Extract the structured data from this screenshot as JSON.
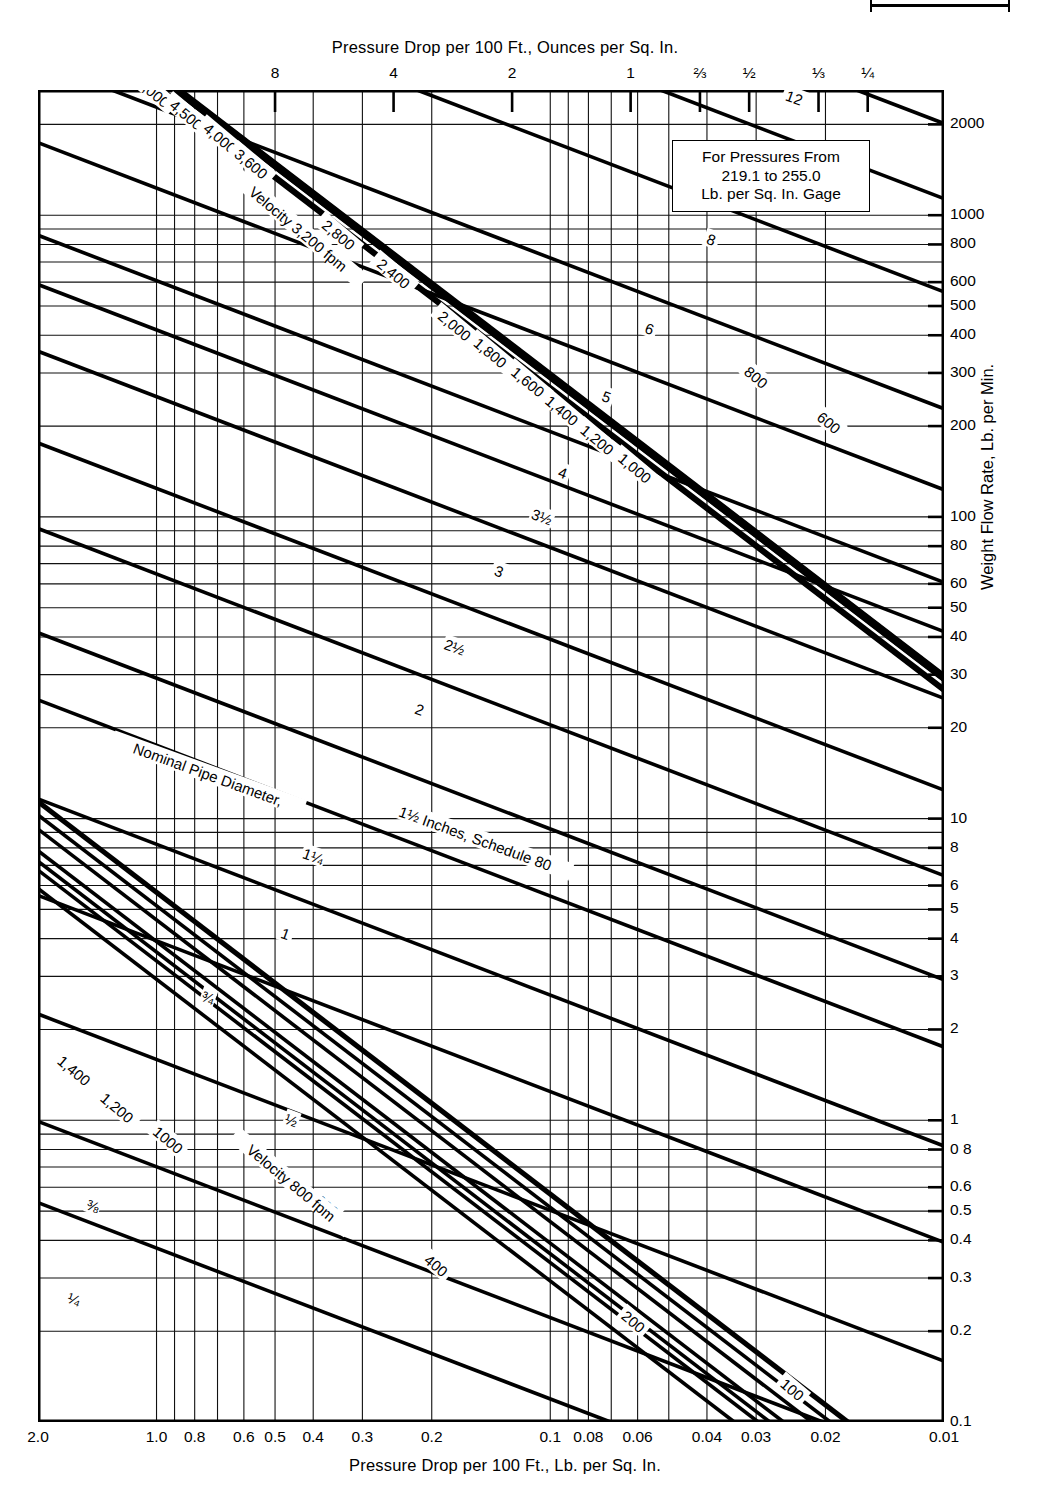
{
  "chart_data": {
    "type": "line",
    "title": "Pressure Drop per 100 Ft., Ounces per Sq. In.",
    "xlabel": "Pressure Drop per 100 Ft., Lb. per Sq. In.",
    "ylabel": "Weight Flow Rate, Lb. per Min.",
    "top_axis_label": "Pressure Drop per 100 Ft., Ounces per Sq. In.",
    "note": {
      "line1": "For Pressures From",
      "line2": "219.1 to 255.0",
      "line3": "Lb. per Sq. In. Gage"
    },
    "grid": "log-log",
    "xlim": [
      2.0,
      0.01
    ],
    "ylim": [
      0.1,
      2600
    ],
    "x_ticks": [
      {
        "label": "2.0",
        "value": 2.0
      },
      {
        "label": "1.0",
        "value": 1.0
      },
      {
        "label": "0.8",
        "value": 0.8
      },
      {
        "label": "0.6",
        "value": 0.6
      },
      {
        "label": "0.5",
        "value": 0.5
      },
      {
        "label": "0.4",
        "value": 0.4
      },
      {
        "label": "0.3",
        "value": 0.3
      },
      {
        "label": "0.2",
        "value": 0.2
      },
      {
        "label": "0.1",
        "value": 0.1
      },
      {
        "label": "0.08",
        "value": 0.08
      },
      {
        "label": "0.06",
        "value": 0.06
      },
      {
        "label": "0.04",
        "value": 0.04
      },
      {
        "label": "0.03",
        "value": 0.03
      },
      {
        "label": "0.02",
        "value": 0.02
      },
      {
        "label": "0.01",
        "value": 0.01
      }
    ],
    "x_ticks_top_ounces": [
      {
        "label": "8",
        "value": 0.5
      },
      {
        "label": "4",
        "value": 0.25
      },
      {
        "label": "2",
        "value": 0.125
      },
      {
        "label": "1",
        "value": 0.0625
      },
      {
        "label": "⅔",
        "value": 0.04167
      },
      {
        "label": "½",
        "value": 0.03125
      },
      {
        "label": "⅓",
        "value": 0.02083
      },
      {
        "label": "¼",
        "value": 0.015625
      }
    ],
    "y_ticks": [
      {
        "label": "2000",
        "value": 2000
      },
      {
        "label": "1000",
        "value": 1000
      },
      {
        "label": "800",
        "value": 800
      },
      {
        "label": "600",
        "value": 600
      },
      {
        "label": "500",
        "value": 500
      },
      {
        "label": "400",
        "value": 400
      },
      {
        "label": "300",
        "value": 300
      },
      {
        "label": "200",
        "value": 200
      },
      {
        "label": "100",
        "value": 100
      },
      {
        "label": "80",
        "value": 80
      },
      {
        "label": "60",
        "value": 60
      },
      {
        "label": "50",
        "value": 50
      },
      {
        "label": "40",
        "value": 40
      },
      {
        "label": "30",
        "value": 30
      },
      {
        "label": "20",
        "value": 20
      },
      {
        "label": "10",
        "value": 10
      },
      {
        "label": "8",
        "value": 8
      },
      {
        "label": "6",
        "value": 6
      },
      {
        "label": "5",
        "value": 5
      },
      {
        "label": "4",
        "value": 4
      },
      {
        "label": "3",
        "value": 3
      },
      {
        "label": "2",
        "value": 2
      },
      {
        "label": "1",
        "value": 1
      },
      {
        "label": "0 8",
        "value": 0.8
      },
      {
        "label": "0.6",
        "value": 0.6
      },
      {
        "label": "0.5",
        "value": 0.5
      },
      {
        "label": "0.4",
        "value": 0.4
      },
      {
        "label": "0.3",
        "value": 0.3
      },
      {
        "label": "0.2",
        "value": 0.2
      },
      {
        "label": "0.1",
        "value": 0.1
      }
    ],
    "series": [
      {
        "name": "Nominal Pipe Diameter, Inches, Schedule 80",
        "family": "pipe-diameter",
        "axis_caption": "Nominal Pipe Diameter, 1½ Inches, Schedule 80",
        "values": [
          "¼",
          "⅜",
          "½",
          "¾",
          "1",
          "1¼",
          "1½",
          "2",
          "2½",
          "3",
          "3½",
          "4",
          "5",
          "6",
          "8",
          "10",
          "12",
          "14",
          "16"
        ]
      },
      {
        "name": "Velocity, fpm",
        "family": "velocity",
        "axis_caption_high": "Velocity 3,200 fpm",
        "axis_caption_low": "Velocity 800 fpm",
        "values": [
          "100",
          "200",
          "400",
          "600",
          "800",
          "1000",
          "1,200",
          "1,400",
          "1,600",
          "1,800",
          "2,000",
          "2,400",
          "2,800",
          "3,200",
          "3,600",
          "4,000",
          "4,500",
          "5,000",
          "6,000",
          "7,000"
        ]
      }
    ]
  }
}
